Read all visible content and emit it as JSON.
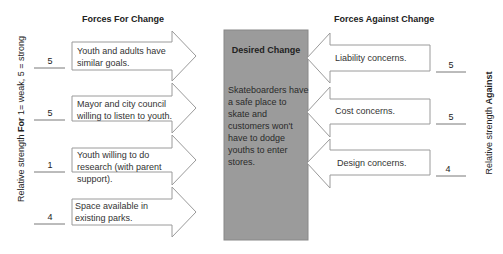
{
  "headers": {
    "for": "Forces For Change",
    "against": "Forces Against Change"
  },
  "desired_change": {
    "title": "Desired Change",
    "text": "Skateboarders have a safe place to skate and customers won't have to dodge youths to enter stores."
  },
  "axis_labels": {
    "left_prefix": "Relative strength ",
    "left_bold": "For",
    "left_suffix": " 1= weak, 5 = strong",
    "right_prefix": "Relative strength ",
    "right_bold": "Against"
  },
  "forces_for": [
    {
      "text": "Youth and adults have similar goals.",
      "strength": "5"
    },
    {
      "text": "Mayor and city council willing to listen to youth.",
      "strength": "5"
    },
    {
      "text": "Youth willing to do research (with parent support).",
      "strength": "1"
    },
    {
      "text": "Space available in existing parks.",
      "strength": "4"
    }
  ],
  "forces_against": [
    {
      "text": "Liability concerns.",
      "strength": "5"
    },
    {
      "text": "Cost concerns.",
      "strength": "5"
    },
    {
      "text": "Design concerns.",
      "strength": "4"
    }
  ],
  "colors": {
    "box_fill": "#9b9b9b",
    "arrow_stroke": "#9a9a9a"
  }
}
